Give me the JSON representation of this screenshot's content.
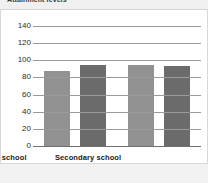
{
  "title": "Attainment levels",
  "chart_data": {
    "type": "bar",
    "title": "Attainment levels",
    "xlabel": "",
    "ylabel": "",
    "categories": [
      "Primary school",
      "Secondary school"
    ],
    "series": [
      {
        "name": "Series 1",
        "color": "#919191",
        "values": [
          87,
          95
        ]
      },
      {
        "name": "Series 2",
        "color": "#6b6b6b",
        "values": [
          95,
          93
        ]
      }
    ],
    "ylim": [
      0,
      140
    ],
    "yticks": [
      0,
      20,
      40,
      60,
      80,
      100,
      120,
      140
    ],
    "ytick_labels": [
      "0",
      "20",
      "40",
      "60",
      "80",
      "100",
      "120",
      "140"
    ],
    "grid": true,
    "legend": "none"
  },
  "colors": {
    "bar_light": "#919191",
    "bar_dark": "#6b6b6b",
    "gridline": "#9a9a9a",
    "title_band": "#f0f0f0",
    "footer_band": "#f2f2f2",
    "card_border": "#d8d8d8"
  }
}
